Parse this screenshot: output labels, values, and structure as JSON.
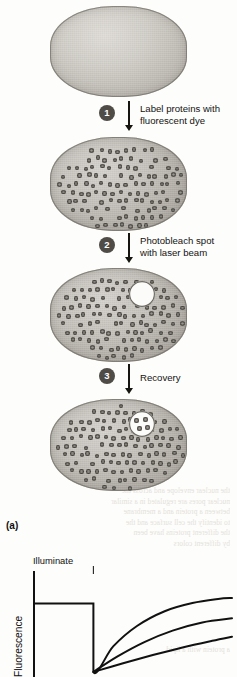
{
  "figure": {
    "panel_label": "(a)",
    "title_semantic": "fluorescence-recovery-after-photobleaching"
  },
  "steps": [
    {
      "number": "1",
      "text": "Label proteins with\nfluorescent dye"
    },
    {
      "number": "2",
      "text": "Photobleach spot\nwith laser beam"
    },
    {
      "number": "3",
      "text": "Recovery"
    }
  ],
  "cells": [
    {
      "state": "unlabeled",
      "has_dots": false,
      "has_spot": false,
      "spot_dots": 0
    },
    {
      "state": "labeled",
      "has_dots": true,
      "has_spot": false,
      "spot_dots": 0
    },
    {
      "state": "bleached",
      "has_dots": true,
      "has_spot": true,
      "spot_dots": 0
    },
    {
      "state": "recovered",
      "has_dots": true,
      "has_spot": true,
      "spot_dots": 4
    }
  ],
  "chart_data": {
    "type": "line",
    "title": "",
    "xlabel": "",
    "ylabel": "Fluorescence",
    "annotations": [
      {
        "label": "Illuminate",
        "x": 0.3
      }
    ],
    "xlim": [
      0,
      1
    ],
    "ylim": [
      0,
      1
    ],
    "grid": false,
    "legend": false,
    "axes": {
      "x_ticks": [],
      "y_ticks": []
    },
    "prebleach_level": 0.72,
    "bleach_x": 0.3,
    "bleach_level": 0.05,
    "series": [
      {
        "name": "high-mobile-fraction",
        "points": [
          [
            0.0,
            0.72
          ],
          [
            0.3,
            0.72
          ],
          [
            0.3,
            0.05
          ],
          [
            0.4,
            0.3
          ],
          [
            0.52,
            0.5
          ],
          [
            0.66,
            0.645
          ],
          [
            0.8,
            0.725
          ],
          [
            0.93,
            0.765
          ],
          [
            1.0,
            0.775
          ]
        ]
      },
      {
        "name": "medium-mobile-fraction",
        "points": [
          [
            0.3,
            0.05
          ],
          [
            0.42,
            0.2
          ],
          [
            0.56,
            0.345
          ],
          [
            0.7,
            0.455
          ],
          [
            0.85,
            0.535
          ],
          [
            1.0,
            0.575
          ]
        ]
      },
      {
        "name": "low-mobile-fraction",
        "points": [
          [
            0.3,
            0.05
          ],
          [
            0.45,
            0.135
          ],
          [
            0.6,
            0.215
          ],
          [
            0.75,
            0.29
          ],
          [
            0.9,
            0.355
          ],
          [
            1.0,
            0.395
          ]
        ]
      }
    ]
  },
  "artifacts": {
    "showthrough_top": "the nuclear envelope and across the\nnuclear pores are regulated in a similar\nbetween a protein and a membrane\nto identify the cell surface and the\nthe different proteins have been\nby different colors",
    "showthrough_bottom": "a protein with a lipid"
  }
}
